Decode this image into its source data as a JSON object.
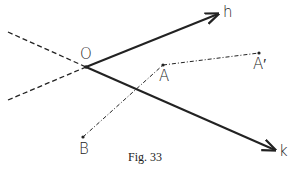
{
  "figure": {
    "caption": "Fig. 33",
    "points": {
      "O": {
        "label": "O",
        "x": 86,
        "y": 67
      },
      "A": {
        "label": "A",
        "x": 163,
        "y": 65
      },
      "A_prime": {
        "label": "A′",
        "x": 259,
        "y": 53
      },
      "B": {
        "label": "B",
        "x": 83,
        "y": 137
      }
    },
    "rays": {
      "h": {
        "label": "h",
        "from": "O",
        "to": [
          218,
          14
        ],
        "style": "solid-arrow"
      },
      "k": {
        "label": "k",
        "from": "O",
        "to": [
          275,
          150
        ],
        "style": "solid-arrow"
      }
    },
    "extensions": [
      {
        "name": "h-opposite",
        "from": "O",
        "to": [
          8,
          100
        ],
        "style": "dashed"
      },
      {
        "name": "k-opposite",
        "from": "O",
        "to": [
          8,
          32
        ],
        "style": "dashed"
      }
    ],
    "segments": [
      {
        "name": "B-A",
        "from": "B",
        "to": "A",
        "style": "dash-dot"
      },
      {
        "name": "A-A_prime",
        "from": "A",
        "to": "A_prime",
        "style": "dash-dot"
      }
    ],
    "colors": {
      "line": "#222222",
      "background": "#ffffff"
    }
  }
}
